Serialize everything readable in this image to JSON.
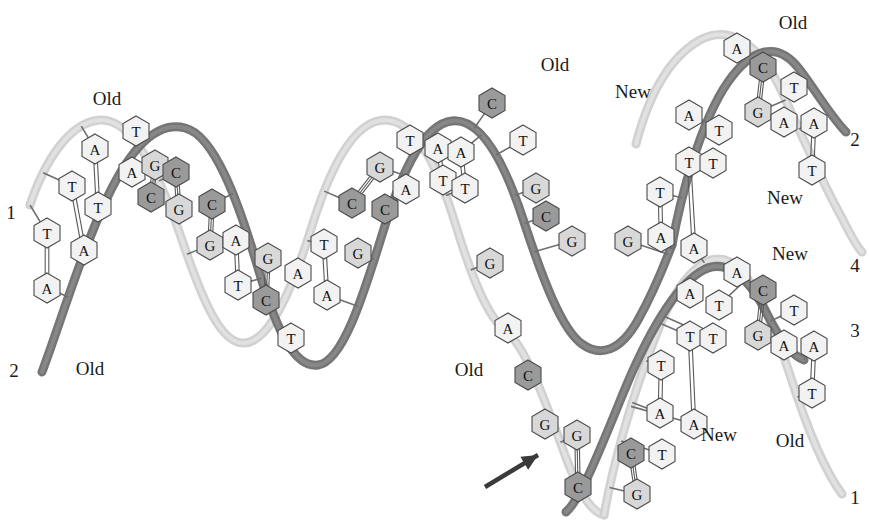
{
  "figure": {
    "background_color": "#ffffff"
  },
  "colors": {
    "old_strand_dark": "#6e6e6e",
    "old_strand_light": "#cfcfcf",
    "new_strand_dark": "#6e6e6e",
    "new_strand_light": "#cfcfcf",
    "base_fill_light": "#f2f2f2",
    "base_fill_c": "#9a9a9a",
    "base_fill_g": "#d8d8d8",
    "base_outline": "#4a4a4a",
    "text_color": "#1a1a1a",
    "arrow_color": "#3a3a3a"
  },
  "labels": {
    "old": "Old",
    "new": "New"
  },
  "annotations": [
    {
      "id": "old-top-left",
      "text": "Old",
      "x": 107,
      "y": 98
    },
    {
      "id": "old-bottom-left",
      "text": "Old",
      "x": 90,
      "y": 368
    },
    {
      "id": "old-top-middle",
      "text": "Old",
      "x": 555,
      "y": 64
    },
    {
      "id": "old-fork-middle",
      "text": "Old",
      "x": 469,
      "y": 369
    },
    {
      "id": "old-top-right",
      "text": "Old",
      "x": 793,
      "y": 22
    },
    {
      "id": "new-upper-left",
      "text": "New",
      "x": 633,
      "y": 91
    },
    {
      "id": "new-upper-right",
      "text": "New",
      "x": 785,
      "y": 197
    },
    {
      "id": "new-lower-upper",
      "text": "New",
      "x": 790,
      "y": 253
    },
    {
      "id": "new-lower-middle",
      "text": "New",
      "x": 719,
      "y": 434
    },
    {
      "id": "old-lower-right",
      "text": "Old",
      "x": 790,
      "y": 440
    }
  ],
  "strand_numbers": [
    {
      "id": "strand-number-1-left",
      "text": "1",
      "x": 11,
      "y": 212
    },
    {
      "id": "strand-number-2-left",
      "text": "2",
      "x": 14,
      "y": 370
    },
    {
      "id": "strand-number-2-upper-right",
      "text": "2",
      "x": 855,
      "y": 139
    },
    {
      "id": "strand-number-4-right",
      "text": "4",
      "x": 855,
      "y": 265
    },
    {
      "id": "strand-number-3-right",
      "text": "3",
      "x": 855,
      "y": 330
    },
    {
      "id": "strand-number-1-lower-right",
      "text": "1",
      "x": 855,
      "y": 497
    }
  ],
  "arrow": {
    "id": "replication-fork-arrow",
    "description": "arrow pointing at replication fork",
    "from_x": 485,
    "from_y": 487,
    "to_x": 538,
    "to_y": 455
  },
  "bases": [
    {
      "id": "b01",
      "letter": "T",
      "x": 47,
      "y": 233,
      "fill": "light"
    },
    {
      "id": "b02",
      "letter": "A",
      "x": 47,
      "y": 288,
      "fill": "light"
    },
    {
      "id": "b03",
      "letter": "T",
      "x": 72,
      "y": 186,
      "fill": "light"
    },
    {
      "id": "b04",
      "letter": "A",
      "x": 95,
      "y": 149,
      "fill": "light"
    },
    {
      "id": "b05",
      "letter": "T",
      "x": 98,
      "y": 207,
      "fill": "light"
    },
    {
      "id": "b06",
      "letter": "A",
      "x": 84,
      "y": 250,
      "fill": "light"
    },
    {
      "id": "b07",
      "letter": "T",
      "x": 136,
      "y": 131,
      "fill": "light"
    },
    {
      "id": "b08",
      "letter": "A",
      "x": 132,
      "y": 172,
      "fill": "light"
    },
    {
      "id": "b09",
      "letter": "G",
      "x": 155,
      "y": 165,
      "fill": "g"
    },
    {
      "id": "b10",
      "letter": "C",
      "x": 151,
      "y": 197,
      "fill": "c"
    },
    {
      "id": "b11",
      "letter": "C",
      "x": 176,
      "y": 172,
      "fill": "c"
    },
    {
      "id": "b12",
      "letter": "G",
      "x": 179,
      "y": 209,
      "fill": "g"
    },
    {
      "id": "b13",
      "letter": "C",
      "x": 212,
      "y": 204,
      "fill": "c"
    },
    {
      "id": "b14",
      "letter": "G",
      "x": 210,
      "y": 245,
      "fill": "g"
    },
    {
      "id": "b15",
      "letter": "A",
      "x": 236,
      "y": 240,
      "fill": "light"
    },
    {
      "id": "b16",
      "letter": "T",
      "x": 238,
      "y": 285,
      "fill": "light"
    },
    {
      "id": "b17",
      "letter": "G",
      "x": 268,
      "y": 258,
      "fill": "g"
    },
    {
      "id": "b18",
      "letter": "C",
      "x": 266,
      "y": 300,
      "fill": "c"
    },
    {
      "id": "b19",
      "letter": "A",
      "x": 298,
      "y": 273,
      "fill": "light"
    },
    {
      "id": "b20",
      "letter": "T",
      "x": 291,
      "y": 338,
      "fill": "light"
    },
    {
      "id": "b21",
      "letter": "T",
      "x": 324,
      "y": 244,
      "fill": "light"
    },
    {
      "id": "b22",
      "letter": "A",
      "x": 327,
      "y": 295,
      "fill": "light"
    },
    {
      "id": "b23",
      "letter": "G",
      "x": 380,
      "y": 167,
      "fill": "g"
    },
    {
      "id": "b24",
      "letter": "C",
      "x": 352,
      "y": 203,
      "fill": "c"
    },
    {
      "id": "b25",
      "letter": "A",
      "x": 406,
      "y": 189,
      "fill": "light"
    },
    {
      "id": "b26",
      "letter": "C",
      "x": 385,
      "y": 209,
      "fill": "c"
    },
    {
      "id": "b27",
      "letter": "G",
      "x": 358,
      "y": 253,
      "fill": "g"
    },
    {
      "id": "b28",
      "letter": "T",
      "x": 410,
      "y": 140,
      "fill": "light"
    },
    {
      "id": "b29",
      "letter": "A",
      "x": 438,
      "y": 148,
      "fill": "light"
    },
    {
      "id": "b30",
      "letter": "A",
      "x": 461,
      "y": 152,
      "fill": "light"
    },
    {
      "id": "b31",
      "letter": "T",
      "x": 443,
      "y": 180,
      "fill": "light"
    },
    {
      "id": "b32",
      "letter": "T",
      "x": 465,
      "y": 188,
      "fill": "light"
    },
    {
      "id": "b33",
      "letter": "C",
      "x": 492,
      "y": 103,
      "fill": "c"
    },
    {
      "id": "b34",
      "letter": "T",
      "x": 523,
      "y": 140,
      "fill": "light"
    },
    {
      "id": "b35",
      "letter": "G",
      "x": 536,
      "y": 188,
      "fill": "g"
    },
    {
      "id": "b36",
      "letter": "C",
      "x": 546,
      "y": 216,
      "fill": "c"
    },
    {
      "id": "b37",
      "letter": "G",
      "x": 572,
      "y": 241,
      "fill": "g"
    },
    {
      "id": "b38",
      "letter": "G",
      "x": 628,
      "y": 241,
      "fill": "g"
    },
    {
      "id": "b39",
      "letter": "G",
      "x": 490,
      "y": 263,
      "fill": "g"
    },
    {
      "id": "b40",
      "letter": "A",
      "x": 508,
      "y": 328,
      "fill": "light"
    },
    {
      "id": "b41",
      "letter": "C",
      "x": 528,
      "y": 375,
      "fill": "c"
    },
    {
      "id": "b42",
      "letter": "G",
      "x": 545,
      "y": 424,
      "fill": "g"
    },
    {
      "id": "b43",
      "letter": "G",
      "x": 577,
      "y": 435,
      "fill": "g"
    },
    {
      "id": "b44",
      "letter": "C",
      "x": 578,
      "y": 487,
      "fill": "c"
    },
    {
      "id": "b45",
      "letter": "C",
      "x": 631,
      "y": 453,
      "fill": "c"
    },
    {
      "id": "b46",
      "letter": "T",
      "x": 662,
      "y": 454,
      "fill": "light"
    },
    {
      "id": "b47",
      "letter": "G",
      "x": 637,
      "y": 494,
      "fill": "g"
    },
    {
      "id": "b48",
      "letter": "A",
      "x": 661,
      "y": 237,
      "fill": "light"
    },
    {
      "id": "b49",
      "letter": "T",
      "x": 660,
      "y": 192,
      "fill": "light"
    },
    {
      "id": "b50",
      "letter": "T",
      "x": 689,
      "y": 162,
      "fill": "light"
    },
    {
      "id": "b51",
      "letter": "A",
      "x": 689,
      "y": 115,
      "fill": "light"
    },
    {
      "id": "b52",
      "letter": "A",
      "x": 694,
      "y": 248,
      "fill": "light"
    },
    {
      "id": "b53",
      "letter": "T",
      "x": 713,
      "y": 163,
      "fill": "light"
    },
    {
      "id": "b54",
      "letter": "T",
      "x": 719,
      "y": 130,
      "fill": "light"
    },
    {
      "id": "b55",
      "letter": "A",
      "x": 737,
      "y": 48,
      "fill": "light"
    },
    {
      "id": "b56",
      "letter": "C",
      "x": 763,
      "y": 67,
      "fill": "c"
    },
    {
      "id": "b57",
      "letter": "G",
      "x": 758,
      "y": 112,
      "fill": "g"
    },
    {
      "id": "b58",
      "letter": "T",
      "x": 794,
      "y": 87,
      "fill": "light"
    },
    {
      "id": "b59",
      "letter": "A",
      "x": 784,
      "y": 122,
      "fill": "light"
    },
    {
      "id": "b60",
      "letter": "A",
      "x": 814,
      "y": 123,
      "fill": "light"
    },
    {
      "id": "b61",
      "letter": "T",
      "x": 812,
      "y": 170,
      "fill": "light"
    },
    {
      "id": "b62",
      "letter": "A",
      "x": 660,
      "y": 413,
      "fill": "light"
    },
    {
      "id": "b63",
      "letter": "T",
      "x": 661,
      "y": 365,
      "fill": "light"
    },
    {
      "id": "b64",
      "letter": "T",
      "x": 690,
      "y": 336,
      "fill": "light"
    },
    {
      "id": "b65",
      "letter": "A",
      "x": 690,
      "y": 293,
      "fill": "light"
    },
    {
      "id": "b66",
      "letter": "A",
      "x": 694,
      "y": 424,
      "fill": "light"
    },
    {
      "id": "b67",
      "letter": "T",
      "x": 713,
      "y": 338,
      "fill": "light"
    },
    {
      "id": "b68",
      "letter": "T",
      "x": 719,
      "y": 305,
      "fill": "light"
    },
    {
      "id": "b69",
      "letter": "A",
      "x": 737,
      "y": 272,
      "fill": "light"
    },
    {
      "id": "b70",
      "letter": "C",
      "x": 763,
      "y": 290,
      "fill": "c"
    },
    {
      "id": "b71",
      "letter": "G",
      "x": 758,
      "y": 335,
      "fill": "g"
    },
    {
      "id": "b72",
      "letter": "T",
      "x": 794,
      "y": 310,
      "fill": "light"
    },
    {
      "id": "b73",
      "letter": "A",
      "x": 784,
      "y": 345,
      "fill": "light"
    },
    {
      "id": "b74",
      "letter": "A",
      "x": 814,
      "y": 346,
      "fill": "light"
    },
    {
      "id": "b75",
      "letter": "T",
      "x": 812,
      "y": 393,
      "fill": "light"
    }
  ],
  "base_pairs": [
    {
      "id": "p01",
      "a": "b01",
      "b": "b02"
    },
    {
      "id": "p02",
      "a": "b04",
      "b": "b05"
    },
    {
      "id": "p03",
      "a": "b03",
      "b": "b06"
    },
    {
      "id": "p04",
      "a": "b09",
      "b": "b10"
    },
    {
      "id": "p05",
      "a": "b11",
      "b": "b12"
    },
    {
      "id": "p06",
      "a": "b13",
      "b": "b14"
    },
    {
      "id": "p07",
      "a": "b15",
      "b": "b16"
    },
    {
      "id": "p08",
      "a": "b17",
      "b": "b18"
    },
    {
      "id": "p09",
      "a": "b21",
      "b": "b22"
    },
    {
      "id": "p10",
      "a": "b23",
      "b": "b24"
    },
    {
      "id": "p11",
      "a": "b25",
      "b": "b26"
    },
    {
      "id": "p12",
      "a": "b29",
      "b": "b31"
    },
    {
      "id": "p13",
      "a": "b30",
      "b": "b32"
    },
    {
      "id": "p14",
      "a": "b43",
      "b": "b44"
    },
    {
      "id": "p15",
      "a": "b45",
      "b": "b47"
    },
    {
      "id": "p16",
      "a": "b49",
      "b": "b48"
    },
    {
      "id": "p17",
      "a": "b50",
      "b": "b52"
    },
    {
      "id": "p18",
      "a": "b56",
      "b": "b57"
    },
    {
      "id": "p19",
      "a": "b60",
      "b": "b61"
    },
    {
      "id": "p20",
      "a": "b63",
      "b": "b62"
    },
    {
      "id": "p21",
      "a": "b64",
      "b": "b66"
    },
    {
      "id": "p22",
      "a": "b70",
      "b": "b71"
    },
    {
      "id": "p23",
      "a": "b74",
      "b": "b75"
    }
  ],
  "strand_paths": [
    {
      "id": "old-strand-light-left",
      "role": "old",
      "shade": "light",
      "width": 9,
      "d": "M 30 205 C 45 160, 70 122, 100 120 C 132 118, 160 175, 182 240 C 204 305, 222 345, 245 343 C 270 341, 292 290, 312 226 C 332 162, 356 120, 385 120 C 414 120, 437 163, 456 226 C 472 278, 488 318, 505 330 C 525 345, 545 400, 565 455 C 580 496, 592 512, 604 515"
    },
    {
      "id": "old-strand-dark-left",
      "role": "old",
      "shade": "dark",
      "width": 9,
      "d": "M 42 372 C 58 330, 82 250, 108 196 C 132 146, 158 121, 185 128 C 214 135, 238 200, 258 268 C 278 336, 296 368, 318 365 C 342 362, 362 300, 382 235 C 402 170, 424 124, 452 121 C 480 118, 504 160, 524 222 C 543 280, 562 330, 582 344 C 600 357, 620 352, 638 320 C 656 288, 668 255, 672 245"
    },
    {
      "id": "new-strand-light-upper",
      "role": "new",
      "shade": "light",
      "width": 9,
      "d": "M 636 144 C 648 98, 668 58, 700 40 C 730 24, 760 44, 782 92 C 802 136, 822 182, 842 218 C 852 238, 858 248, 862 252"
    },
    {
      "id": "old-strand-dark-upper",
      "role": "old",
      "shade": "dark",
      "width": 9,
      "d": "M 672 245 C 680 200, 700 122, 728 82 C 752 48, 778 40, 800 70 C 818 94, 832 118, 846 132"
    },
    {
      "id": "new-strand-light-lower",
      "role": "new",
      "shade": "light",
      "width": 9,
      "d": "M 604 515 C 612 470, 630 400, 658 330 C 680 276, 706 250, 730 262 C 752 273, 772 320, 790 375 C 806 425, 824 470, 842 494"
    },
    {
      "id": "old-strand-dark-lower",
      "role": "old",
      "shade": "dark",
      "width": 9,
      "d": "M 566 512 C 580 500, 600 450, 622 396 C 644 342, 672 290, 700 272 C 724 256, 748 276, 766 312 C 780 340, 792 356, 804 360"
    }
  ]
}
